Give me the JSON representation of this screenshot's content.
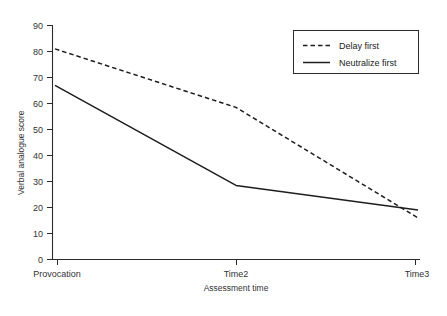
{
  "chart_data": {
    "type": "line",
    "title": "",
    "xlabel": "Assessment time",
    "ylabel": "Verbal analogue score",
    "categories": [
      "Provocation",
      "Time2",
      "Time3"
    ],
    "ylim": [
      0,
      90
    ],
    "yticks": [
      0,
      10,
      20,
      30,
      40,
      50,
      60,
      70,
      80,
      90
    ],
    "ytick_labels": [
      "0",
      "10",
      "20",
      "30",
      "40",
      "50",
      "60",
      "70",
      "80",
      "90"
    ],
    "grid": false,
    "legend_position": "top-right",
    "series": [
      {
        "name": "Delay first",
        "style": "dashed",
        "color": "#1d1d1d",
        "values": [
          81,
          58.5,
          16
        ]
      },
      {
        "name": "Neutralize first",
        "style": "solid",
        "color": "#1d1d1d",
        "values": [
          67,
          28.5,
          19
        ]
      }
    ]
  },
  "axis": {
    "y_title": "Verbal analogue score",
    "x_title": "Assessment time",
    "x_tick_labels": [
      "Provocation",
      "Time2",
      "Time3"
    ],
    "y_tick_labels": [
      "90",
      "80",
      "70",
      "60",
      "50",
      "40",
      "30",
      "20",
      "10",
      "0"
    ]
  },
  "legend": {
    "entries": [
      {
        "label": "Delay first",
        "style": "dashed"
      },
      {
        "label": "Neutralize first",
        "style": "solid"
      }
    ]
  }
}
